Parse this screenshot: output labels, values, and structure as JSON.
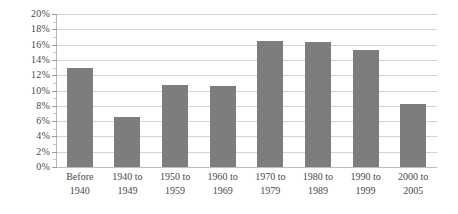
{
  "chart_data": {
    "type": "bar",
    "title": "",
    "subtitle": "",
    "xlabel": "",
    "ylabel": "",
    "categories": [
      "Before 1940",
      "1940 to 1949",
      "1950 to 1959",
      "1960 to 1969",
      "1970 to 1979",
      "1980 to 1989",
      "1990 to 1999",
      "2000 to 2005"
    ],
    "category_lines": [
      [
        "Before",
        "1940"
      ],
      [
        "1940 to",
        "1949"
      ],
      [
        "1950 to",
        "1959"
      ],
      [
        "1960 to",
        "1969"
      ],
      [
        "1970 to",
        "1979"
      ],
      [
        "1980 to",
        "1989"
      ],
      [
        "1990 to",
        "1999"
      ],
      [
        "2000 to",
        "2005"
      ]
    ],
    "values": [
      12.9,
      6.5,
      10.7,
      10.6,
      16.5,
      16.3,
      15.3,
      8.2
    ],
    "ylim": [
      0,
      20
    ],
    "ytick_values": [
      0,
      2,
      4,
      6,
      8,
      10,
      12,
      14,
      16,
      18,
      20
    ],
    "ytick_labels": [
      "0%",
      "2%",
      "4%",
      "6%",
      "8%",
      "10%",
      "12%",
      "14%",
      "16%",
      "18%",
      "20%"
    ],
    "grid": true,
    "grid_axis": "y",
    "minor_ticks": true,
    "legend": false,
    "legend_position": "none",
    "bar_color": "#7d7d7d",
    "gridline_color": "#d3d3d3",
    "axis_color": "#b5b5b5",
    "text_color": "#4a4a4a",
    "background_color": "#ffffff"
  }
}
